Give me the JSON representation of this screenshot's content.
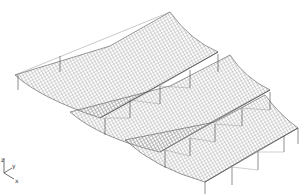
{
  "view": {
    "type": "isometric-wireframe",
    "subject": "curved roof shell structure",
    "bays": 3,
    "colors": {
      "background": "#ffffff",
      "mesh": "#555555",
      "mesh_light": "#9a9a9a",
      "columns": "#444444"
    }
  },
  "axis_triad": {
    "labels": {
      "z": "z",
      "y": "y",
      "x": "x"
    }
  }
}
